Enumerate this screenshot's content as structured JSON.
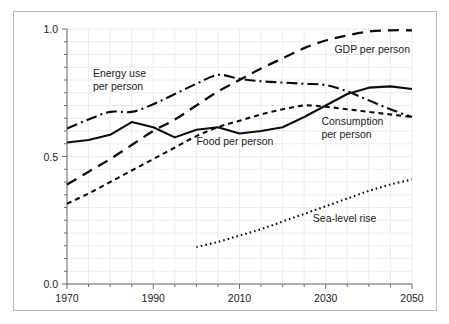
{
  "chart_data": {
    "type": "line",
    "title": "",
    "subtitle": "",
    "xlabel": "",
    "ylabel": "",
    "xlim": [
      1970,
      2050
    ],
    "ylim": [
      0.0,
      1.0
    ],
    "grid": true,
    "legend_position": "inline-annotations",
    "x_ticks": [
      "1970",
      "1990",
      "2010",
      "2030",
      "2050"
    ],
    "x_tick_values": [
      1970,
      1990,
      2010,
      2030,
      2050
    ],
    "x_minor_tick_values": [
      1975,
      1980,
      1985,
      1995,
      2000,
      2005,
      2015,
      2020,
      2025,
      2035,
      2040,
      2045
    ],
    "y_ticks": [
      "0.0",
      "0.5",
      "1.0"
    ],
    "y_tick_values": [
      0.0,
      0.5,
      1.0
    ],
    "y_minor_tick_values": [
      0.05,
      0.1,
      0.15,
      0.2,
      0.25,
      0.3,
      0.35,
      0.4,
      0.45,
      0.55,
      0.6,
      0.65,
      0.7,
      0.75,
      0.8,
      0.85,
      0.9,
      0.95
    ],
    "series": [
      {
        "name": "GDP per person",
        "style": "long-dash",
        "color": "#0d0d0d",
        "x": [
          1970,
          1975,
          1980,
          1985,
          1990,
          1995,
          2000,
          2005,
          2010,
          2015,
          2020,
          2025,
          2030,
          2035,
          2040,
          2045,
          2050
        ],
        "values": [
          0.39,
          0.44,
          0.49,
          0.545,
          0.6,
          0.645,
          0.7,
          0.755,
          0.8,
          0.845,
          0.885,
          0.925,
          0.955,
          0.975,
          0.99,
          0.995,
          0.995
        ]
      },
      {
        "name": "Energy use per person",
        "style": "dash-dot",
        "color": "#0d0d0d",
        "x": [
          1970,
          1975,
          1980,
          1985,
          1990,
          1995,
          2000,
          2005,
          2010,
          2015,
          2020,
          2025,
          2030,
          2035,
          2040,
          2045,
          2050
        ],
        "values": [
          0.61,
          0.645,
          0.675,
          0.675,
          0.705,
          0.745,
          0.785,
          0.82,
          0.805,
          0.795,
          0.79,
          0.785,
          0.78,
          0.755,
          0.72,
          0.685,
          0.655
        ]
      },
      {
        "name": "Food per person",
        "style": "solid",
        "color": "#0d0d0d",
        "x": [
          1970,
          1975,
          1980,
          1985,
          1990,
          1995,
          2000,
          2005,
          2010,
          2015,
          2020,
          2025,
          2030,
          2035,
          2040,
          2045,
          2050
        ],
        "values": [
          0.555,
          0.565,
          0.585,
          0.635,
          0.615,
          0.575,
          0.605,
          0.615,
          0.59,
          0.6,
          0.615,
          0.655,
          0.7,
          0.745,
          0.77,
          0.775,
          0.765
        ]
      },
      {
        "name": "Consumption per person",
        "style": "short-dash",
        "color": "#0d0d0d",
        "x": [
          1970,
          1975,
          1980,
          1985,
          1990,
          1995,
          2000,
          2005,
          2010,
          2015,
          2020,
          2025,
          2030,
          2035,
          2040,
          2045,
          2050
        ],
        "values": [
          0.315,
          0.355,
          0.4,
          0.445,
          0.49,
          0.535,
          0.58,
          0.615,
          0.64,
          0.665,
          0.685,
          0.7,
          0.695,
          0.685,
          0.675,
          0.665,
          0.655
        ]
      },
      {
        "name": "Sea-level rise",
        "style": "dotted",
        "color": "#0d0d0d",
        "x": [
          2000,
          2005,
          2010,
          2015,
          2020,
          2025,
          2030,
          2035,
          2040,
          2045,
          2050
        ],
        "values": [
          0.145,
          0.165,
          0.19,
          0.215,
          0.245,
          0.275,
          0.305,
          0.335,
          0.365,
          0.39,
          0.41
        ]
      }
    ],
    "annotations": [
      {
        "id": "gdp",
        "lines": [
          "GDP per person"
        ],
        "x": 2032,
        "y": 0.905,
        "anchor": "start"
      },
      {
        "id": "energy",
        "lines": [
          "Energy use",
          "per person"
        ],
        "x": 1976,
        "y": 0.81,
        "anchor": "start"
      },
      {
        "id": "food",
        "lines": [
          "Food per person"
        ],
        "x": 2000,
        "y": 0.545,
        "anchor": "start"
      },
      {
        "id": "consumption",
        "lines": [
          "Consumption",
          "per person"
        ],
        "x": 2029,
        "y": 0.625,
        "anchor": "start"
      },
      {
        "id": "sealevel",
        "lines": [
          "Sea-level rise"
        ],
        "x": 2027,
        "y": 0.245,
        "anchor": "start"
      }
    ]
  }
}
